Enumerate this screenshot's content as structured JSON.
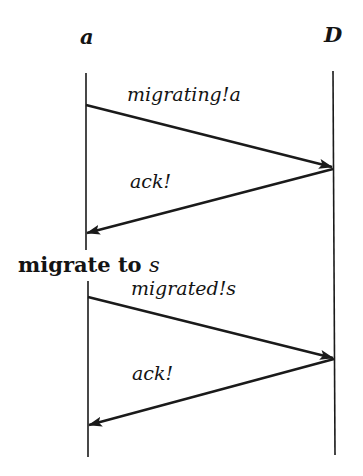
{
  "diagram": {
    "type": "sequence-diagram",
    "participants": [
      {
        "id": "a",
        "label": "a"
      },
      {
        "id": "D",
        "label": "D"
      }
    ],
    "messages": [
      {
        "from": "a",
        "to": "D",
        "label": "migrating!a"
      },
      {
        "from": "D",
        "to": "a",
        "label": "ack!"
      },
      {
        "from": "a",
        "to": "D",
        "label": "migrated!s"
      },
      {
        "from": "D",
        "to": "a",
        "label": "ack!"
      }
    ],
    "events": [
      {
        "participant": "a",
        "label_bold": "migrate to",
        "label_var": "s"
      }
    ],
    "colors": {
      "line": "#1a1a1a",
      "background": "#ffffff"
    }
  }
}
